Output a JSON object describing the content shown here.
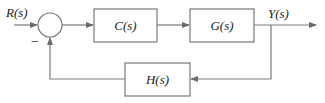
{
  "diagram": {
    "type": "feedback-control-block-diagram",
    "input_label": "R(s)",
    "output_label": "Y(s)",
    "summing_junction": {
      "feedback_sign": "−"
    },
    "blocks": [
      {
        "id": "controller",
        "label": "C(s)"
      },
      {
        "id": "plant",
        "label": "G(s)"
      },
      {
        "id": "feedback",
        "label": "H(s)"
      }
    ],
    "colors": {
      "line": "#7a7a7a",
      "text": "#222222",
      "background": "#ffffff"
    }
  }
}
